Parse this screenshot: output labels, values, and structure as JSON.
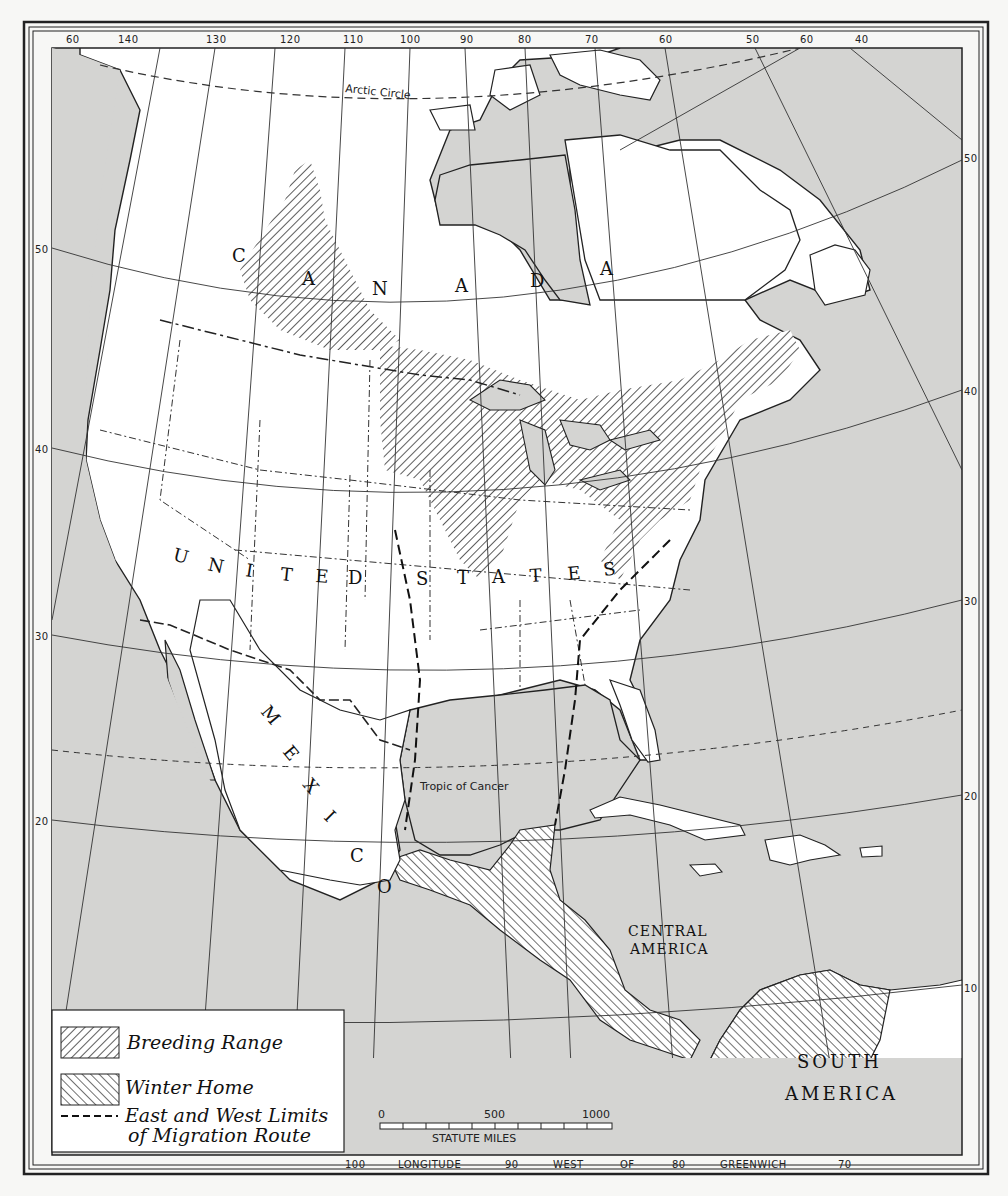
{
  "map": {
    "title": "Migration Route Map of North America",
    "colors": {
      "water": "#d4d4d2",
      "land": "#ffffff",
      "ink": "#1a1a1a",
      "paper": "#f7f7f5"
    },
    "top_longitude_labels": [
      "60",
      "140",
      "130",
      "120",
      "110",
      "100",
      "90",
      "80",
      "70",
      "60",
      "50",
      "60",
      "40"
    ],
    "bottom_longitude_labels": {
      "l100": "100",
      "longitude": "LONGITUDE",
      "l90": "90",
      "west": "WEST",
      "of": "OF",
      "l80": "80",
      "greenwich": "GREENWICH",
      "l70": "70"
    },
    "left_latitude_labels": [
      "50",
      "40",
      "30",
      "20"
    ],
    "right_latitude_labels": [
      "50",
      "40",
      "30",
      "20",
      "10"
    ],
    "lines": {
      "arctic_circle": "Arctic Circle",
      "tropic_of_cancer": "Tropic of Cancer"
    },
    "place_labels": {
      "canada": [
        "C",
        "A",
        "N",
        "A",
        "D",
        "A"
      ],
      "united_states": [
        "U",
        "N",
        "I",
        "T",
        "E",
        "D",
        "S",
        "T",
        "A",
        "T",
        "E",
        "S"
      ],
      "mexico": [
        "M",
        "E",
        "X",
        "I",
        "C",
        "O"
      ],
      "central_america_line1": "CENTRAL",
      "central_america_line2": "AMERICA",
      "south_america_line1": "SOUTH",
      "south_america_line2": "AMERICA"
    },
    "scale_bar": {
      "tick_0": "0",
      "tick_500": "500",
      "tick_1000": "1000",
      "unit": "STATUTE MILES"
    },
    "legend": {
      "items": [
        {
          "symbol": "hatch-backslash",
          "label": "Breeding Range"
        },
        {
          "symbol": "hatch-slash",
          "label": "Winter Home"
        },
        {
          "symbol": "dashed-line",
          "label_line1": "East and West Limits",
          "label_line2": "of Migration Route"
        }
      ]
    }
  }
}
